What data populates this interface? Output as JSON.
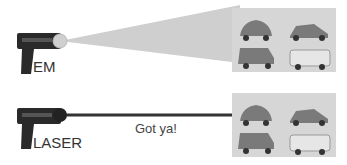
{
  "rows": [
    {
      "id": "em",
      "label": "EM",
      "beam": "wide-cone",
      "emitter_color": "#cfcfcf",
      "beam_color": "#cfcfcf",
      "targets": [
        "car-compact",
        "car-sports",
        "jeep",
        "van"
      ]
    },
    {
      "id": "laser",
      "label": "LASER",
      "beam": "narrow-line",
      "emitter_color": "#222222",
      "beam_color": "#333333",
      "caption": "Got ya!",
      "targets": [
        "car-compact",
        "car-sports",
        "jeep",
        "van"
      ]
    }
  ],
  "colors": {
    "gun": "#2a2a2a",
    "panel": "#d6d6d6",
    "vehicle": "#7a7a7a",
    "van": "#e6e6e6"
  }
}
